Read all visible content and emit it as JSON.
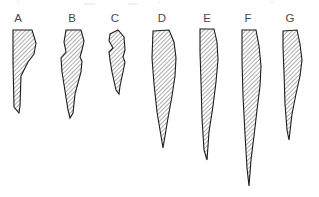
{
  "figure": {
    "title": "Comparative outlines of seven hatched blade-shaped specimens",
    "background_color": "#ffffff",
    "width": 319,
    "height": 197,
    "outline_color": "#1b1b1b",
    "hatch_color": "#3a3a3a",
    "hatch_fill_color": "#ffffff",
    "label_color": "#4a4a4a",
    "hatch_angle_degrees": 45,
    "specimen_count": 7
  },
  "chart_data": {
    "type": "diagram",
    "title": "Comparative outlines of seven hatched blade-shaped specimens",
    "xlabel": "",
    "ylabel": "",
    "categories": [
      "A",
      "B",
      "C",
      "D",
      "E",
      "F",
      "G"
    ],
    "series": [
      {
        "name": "length_px",
        "values": [
          84,
          96,
          70,
          119,
          133,
          156,
          113
        ]
      },
      {
        "name": "max_width_px",
        "values": [
          22,
          19,
          17,
          23,
          16,
          17,
          19
        ]
      }
    ]
  },
  "specimens": [
    {
      "id": "A",
      "label": "A",
      "label_x": 18,
      "label_y": 22,
      "outline_points": "13,30 32,30 36,43 34,54 28,62 21,76 20,106 19,113 14,107 13,62",
      "length_px": 84,
      "max_width_px": 22
    },
    {
      "id": "B",
      "label": "B",
      "label_x": 72,
      "label_y": 22,
      "outline_points": "66,30 81,30 84,41 82,50 80,57 82,61 81,72 75,94 73,113 70,118 68,110 62,72 61,58 66,52 64,42",
      "length_px": 96,
      "max_width_px": 19
    },
    {
      "id": "C",
      "label": "C",
      "label_x": 115,
      "label_y": 22,
      "outline_points": "110,34 118,30 124,37 125,50 123,57 125,62 123,72 120,86 119,94 116,90 112,72 110,60 109,52 113,48 109,41",
      "length_px": 70,
      "max_width_px": 17
    },
    {
      "id": "D",
      "label": "D",
      "label_x": 162,
      "label_y": 22,
      "outline_points": "153,31 169,30 174,42 176,58 175,76 172,96 168,118 165,136 163,148 161,136 157,112 154,84 152,58",
      "length_px": 119,
      "max_width_px": 23
    },
    {
      "id": "E",
      "label": "E",
      "label_x": 207,
      "label_y": 22,
      "outline_points": "200,29 214,29 217,42 218,60 216,82 213,106 209,132 207,160 204,150 202,118 201,82 200,52",
      "length_px": 133,
      "max_width_px": 16
    },
    {
      "id": "F",
      "label": "F",
      "label_x": 248,
      "label_y": 22,
      "outline_points": "242,30 256,30 259,46 261,66 260,86 257,110 254,136 251,160 249,186 247,168 245,134 243,96 242,60",
      "length_px": 156,
      "max_width_px": 17
    },
    {
      "id": "G",
      "label": "G",
      "label_x": 290,
      "label_y": 22,
      "outline_points": "283,31 297,30 300,44 302,60 300,76 296,94 292,114 289,140 287,130 285,104 284,72 283,48",
      "length_px": 113,
      "max_width_px": 19
    }
  ]
}
